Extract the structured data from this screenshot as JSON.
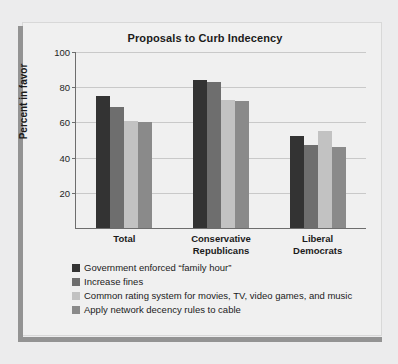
{
  "chart_data": {
    "type": "bar",
    "title": "Proposals to Curb Indecency",
    "xlabel": "",
    "ylabel": "Percent in favor",
    "ylim": [
      0,
      100
    ],
    "yticks": [
      20,
      40,
      60,
      80,
      100
    ],
    "grid": true,
    "legend_position": "below",
    "categories": [
      "Total",
      "Conservative Republicans",
      "Liberal Democrats"
    ],
    "category_lines": [
      [
        "Total"
      ],
      [
        "Conservative",
        "Republicans"
      ],
      [
        "Liberal",
        "Democrats"
      ]
    ],
    "series": [
      {
        "name": "Government enforced “family hour”",
        "color": "#333333",
        "values": [
          75,
          84,
          52
        ]
      },
      {
        "name": "Increase fines",
        "color": "#6e6e6e",
        "values": [
          69,
          83,
          47
        ]
      },
      {
        "name": "Common rating system for movies, TV, video games, and music",
        "color": "#c2c2c2",
        "values": [
          61,
          73,
          55
        ]
      },
      {
        "name": "Apply network decency rules to cable",
        "color": "#8a8a8a",
        "values": [
          60,
          72,
          46
        ]
      }
    ]
  },
  "frame": {
    "rule_color": "#939393"
  }
}
